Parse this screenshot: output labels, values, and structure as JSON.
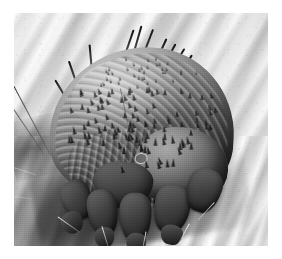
{
  "page": {
    "background_color": "#ffffff",
    "width": 282,
    "height": 259
  },
  "figure": {
    "type": "scanning-electron-micrograph",
    "caption": "",
    "frame": {
      "left": 14,
      "top": 13,
      "width": 254,
      "height": 233
    },
    "palette": {
      "background_skin_light": "#eeeeec",
      "background_skin_mid": "#cfcfcc",
      "background_skin_shadow": "#3a3a38",
      "mite_highlight": "#b4b4b1",
      "mite_midtone": "#7a7a77",
      "mite_shadow": "#2a2a28",
      "spine_color": "#161614",
      "seta_color": "#0c0c0a",
      "page_white": "#ffffff"
    },
    "subject": {
      "common_name": "itch mite",
      "orientation": "dorsal-oblique, head toward lower right",
      "features": [
        "domed dorsal idiosoma with concentric cuticular striations",
        "dense field of triangular dorsal denticles (spines)",
        "several long dark dorsal setae projecting upper-right",
        "fine pale setae projecting to the left across the substrate",
        "four stout stump-like legs with tarsi under the body front",
        "small circular cuticular scar mark mid-dorsum",
        "dark cast shadow beneath the body on the skin"
      ]
    },
    "substrate": {
      "name": "human skin surface",
      "features": [
        "diagonal skin furrows running from lower-left to upper-right",
        "bright specular ridges between furrows",
        "smooth low-contrast grain"
      ]
    }
  }
}
